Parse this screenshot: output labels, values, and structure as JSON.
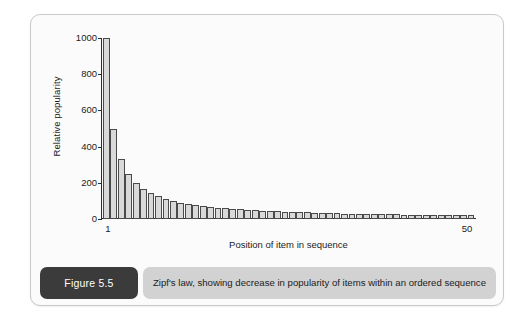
{
  "figure": {
    "badge_label": "Figure 5.5",
    "caption": "Zipf's law, showing decrease in popularity of items within an ordered sequence",
    "badge_color": "#3b3b3b",
    "caption_bar_color": "#d2d2d2",
    "frame_color": "#c9c9c9"
  },
  "chart_data": {
    "type": "bar",
    "title": "",
    "xlabel": "Position of item in sequence",
    "ylabel": "Relative popularity",
    "xlim": [
      1,
      50
    ],
    "ylim": [
      0,
      1000
    ],
    "grid": false,
    "legend": null,
    "bar_fill_color": "#d9d9d9",
    "bar_edge_color": "#4a4a4a",
    "axis_color": "#2b2b2b",
    "y_ticks": [
      0,
      200,
      400,
      600,
      800,
      1000
    ],
    "y_tick_labels": [
      "0",
      "200",
      "400",
      "600",
      "800",
      "1000"
    ],
    "x_tick_labels": [
      "1",
      "50"
    ],
    "x_ticks": [
      1,
      50
    ],
    "categories": [
      1,
      2,
      3,
      4,
      5,
      6,
      7,
      8,
      9,
      10,
      11,
      12,
      13,
      14,
      15,
      16,
      17,
      18,
      19,
      20,
      21,
      22,
      23,
      24,
      25,
      26,
      27,
      28,
      29,
      30,
      31,
      32,
      33,
      34,
      35,
      36,
      37,
      38,
      39,
      40,
      41,
      42,
      43,
      44,
      45,
      46,
      47,
      48,
      49,
      50
    ],
    "values": [
      1000,
      500,
      333,
      250,
      200,
      167,
      143,
      125,
      111,
      100,
      91,
      83,
      77,
      71,
      67,
      63,
      59,
      56,
      53,
      50,
      48,
      45,
      43,
      42,
      40,
      38,
      37,
      36,
      34,
      33,
      32,
      31,
      30,
      29,
      29,
      28,
      27,
      26,
      26,
      25,
      24,
      24,
      23,
      23,
      22,
      22,
      21,
      21,
      20,
      20
    ],
    "formula": "1000 / n"
  }
}
